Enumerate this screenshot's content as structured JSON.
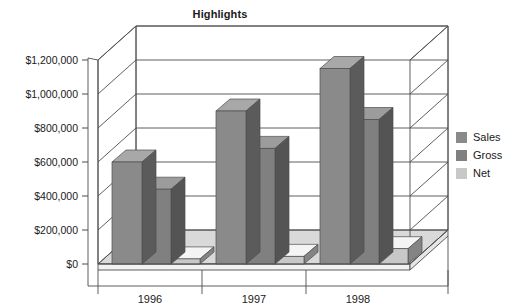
{
  "chart_data": {
    "type": "bar",
    "title": "Highlights",
    "subtitle": "",
    "xlabel": "",
    "ylabel": "",
    "categories": [
      "1996",
      "1997",
      "1998"
    ],
    "series": [
      {
        "name": "Sales",
        "values": [
          600000,
          900000,
          1150000
        ],
        "color": "#8a8a8a"
      },
      {
        "name": "Gross",
        "values": [
          440000,
          680000,
          850000
        ],
        "color": "#808080"
      },
      {
        "name": "Net",
        "values": [
          30000,
          45000,
          90000
        ],
        "color": "#c8c8c8"
      }
    ],
    "ylim": [
      0,
      1200000
    ],
    "ytick_values": [
      0,
      200000,
      400000,
      600000,
      800000,
      1000000,
      1200000
    ],
    "ytick_labels": [
      "$0",
      "$200,000",
      "$400,000",
      "$600,000",
      "$800,000",
      "$1,000,000",
      "$1,200,000"
    ],
    "grid": true,
    "grid_axis": "y",
    "legend_position": "right",
    "three_d": true,
    "background": "#ffffff",
    "floor_color": "#d9d9d9",
    "frame_color": "#4d4d4d"
  },
  "legend": {
    "entries": [
      {
        "label": "Sales",
        "color": "#8a8a8a"
      },
      {
        "label": "Gross",
        "color": "#808080"
      },
      {
        "label": "Net",
        "color": "#c8c8c8"
      }
    ]
  }
}
